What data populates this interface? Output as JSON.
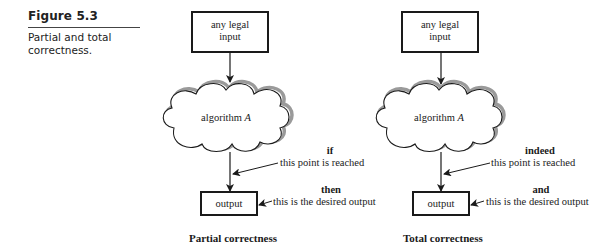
{
  "figure": {
    "label": "Figure 5.3",
    "caption": "Partial and total correctness."
  },
  "panels": [
    {
      "id": "partial",
      "input_box": {
        "line1": "any legal",
        "line2": "input"
      },
      "algorithm": {
        "text": "algorithm",
        "var": "A"
      },
      "annotation1": {
        "keyword": "if",
        "text": "this point is reached"
      },
      "annotation2": {
        "keyword": "then",
        "text": "this is the desired output"
      },
      "output_box": "output",
      "title": "Partial correctness"
    },
    {
      "id": "total",
      "input_box": {
        "line1": "any legal",
        "line2": "input"
      },
      "algorithm": {
        "text": "algorithm",
        "var": "A"
      },
      "annotation1": {
        "keyword": "indeed",
        "text": "this point is reached"
      },
      "annotation2": {
        "keyword": "and",
        "text": "this is the desired output"
      },
      "output_box": "output",
      "title": "Total correctness"
    }
  ],
  "colors": {
    "stroke": "#1a1a1a",
    "shadow": "#9a9a9a",
    "background": "#ffffff"
  }
}
